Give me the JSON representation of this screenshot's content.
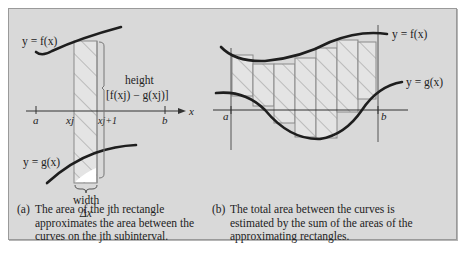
{
  "figure": {
    "colors": {
      "background": "#d9d9d9",
      "frame_border": "#9a9a9a",
      "curve": "#1e1e1e",
      "rect_stroke": "#8a8a8a",
      "rect_fill": "#e4e4e4",
      "hatch": "#8a8a8a",
      "axis": "#333333"
    },
    "panel_a": {
      "curve_f_label": "y = f(x)",
      "curve_g_label": "y = g(x)",
      "height_label": "height",
      "height_expr": "[f(xj) − g(xj)]",
      "width_label": "width",
      "width_symbol": "Δx",
      "axis_label": "x",
      "tick_a": "a",
      "tick_xj": "xj",
      "tick_xj1": "xj+1",
      "tick_b": "b",
      "caption_tag": "(a)",
      "caption": "The area of the jth rectangle approximates the area between the curves on the jth subinterval."
    },
    "panel_b": {
      "curve_f_label": "y = f(x)",
      "curve_g_label": "y = g(x)",
      "tick_a": "a",
      "tick_b": "b",
      "rectangle_count": 6,
      "caption_tag": "(b)",
      "caption": "The total area between the curves is estimated by the sum of the areas of the approximating rectangles."
    }
  }
}
